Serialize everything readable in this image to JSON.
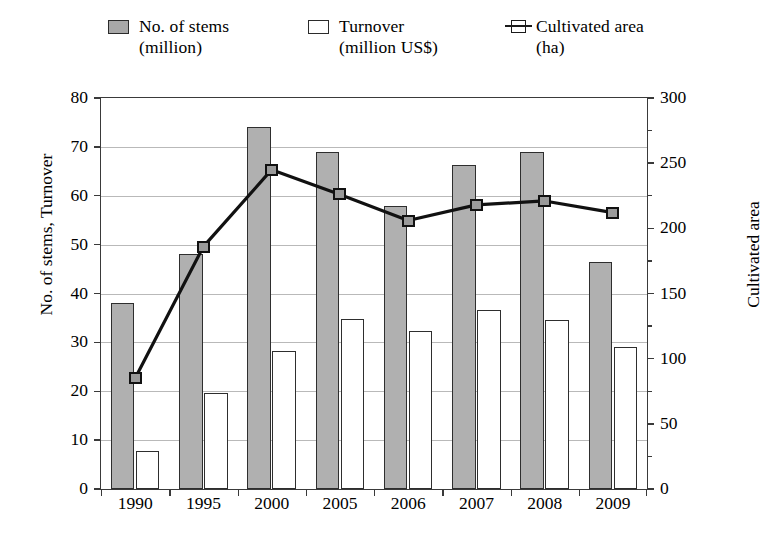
{
  "chart_data": {
    "type": "bar",
    "title": "",
    "categories": [
      "1990",
      "1995",
      "2000",
      "2005",
      "2006",
      "2007",
      "2008",
      "2009"
    ],
    "series": [
      {
        "name": "No. of stems (million)",
        "axis": "left",
        "style": "bar-filled",
        "values": [
          38,
          48,
          74,
          69,
          58,
          66.3,
          69,
          46.5
        ]
      },
      {
        "name": "Turnover (million US$)",
        "axis": "left",
        "style": "bar-open",
        "values": [
          7.8,
          19.7,
          28.2,
          34.7,
          32.3,
          36.7,
          34.6,
          29
        ]
      },
      {
        "name": "Cultivated area (ha)",
        "axis": "right",
        "style": "line-marker",
        "values": [
          85,
          186,
          245,
          226,
          206,
          218,
          221,
          212
        ]
      }
    ],
    "xlabel": "",
    "ylabel": "No. of stems, Turnover",
    "ylabel_right": "Cultivated area",
    "ylim": [
      0,
      80
    ],
    "yticks": [
      0,
      10,
      20,
      30,
      40,
      50,
      60,
      70,
      80
    ],
    "ylim_right": [
      0,
      300
    ],
    "yticks_right": [
      0,
      50,
      100,
      150,
      200,
      250,
      300
    ],
    "grid": true,
    "legend_position": "top"
  },
  "legend": {
    "items": [
      {
        "marker": "filled-square-swatch",
        "line1": "No. of stems",
        "line2": "(million)"
      },
      {
        "marker": "open-square-swatch",
        "line1": "Turnover",
        "line2": "(million US$)"
      },
      {
        "marker": "line-marker-swatch",
        "line1": "Cultivated area",
        "line2": "(ha)"
      }
    ]
  }
}
